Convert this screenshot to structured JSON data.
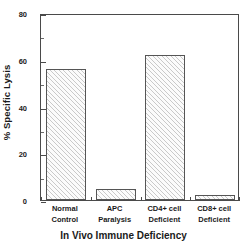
{
  "chart_data": {
    "type": "bar",
    "title": "",
    "xlabel": "In Vivo Immune Deficiency",
    "ylabel": "% Specific Lysis",
    "categories": [
      "Normal Control",
      "APC Paralysis",
      "CD4+ cell Deficient",
      "CD8+ cell Deficient"
    ],
    "category_lines": [
      [
        "Normal",
        "Control"
      ],
      [
        "APC",
        "Paralysis"
      ],
      [
        "CD4+ cell",
        "Deficient"
      ],
      [
        "CD8+ cell",
        "Deficient"
      ]
    ],
    "values": [
      56,
      4.7,
      62,
      2.1
    ],
    "ylim": [
      0,
      80
    ],
    "yticks": [
      0,
      20,
      40,
      60,
      80
    ],
    "ytick_labels": [
      "0",
      "20",
      "40",
      "60",
      "80"
    ],
    "yminor_ticks": [
      10,
      30,
      50,
      70
    ],
    "grid": false,
    "legend": null,
    "bar_style": "diagonal-hatch",
    "colors": {
      "bar_fill": "#fbfbfb",
      "bar_hatch": "#c9c9c9",
      "bar_edge": "#555555",
      "axis": "#4a4a4a",
      "text": "#1a1a1a",
      "background": "#ffffff"
    }
  }
}
